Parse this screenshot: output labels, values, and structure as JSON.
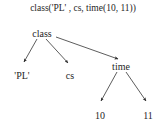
{
  "figure": {
    "caption": "class('PL' , cs, time(10, 11))",
    "type": "parse-tree",
    "line_color": "#333333",
    "text_color": "#262626",
    "background_color": "#ffffff"
  },
  "tree": {
    "root": {
      "label": "class",
      "children": [
        {
          "label": "'PL'",
          "children": []
        },
        {
          "label": "cs",
          "children": []
        },
        {
          "label": "time",
          "children": [
            {
              "label": "10",
              "children": []
            },
            {
              "label": "11",
              "children": []
            }
          ]
        }
      ]
    }
  },
  "nodes": [
    {
      "id": "root",
      "label": "class",
      "x": 42,
      "y": 34
    },
    {
      "id": "pl",
      "label": "'PL'",
      "x": 22,
      "y": 76
    },
    {
      "id": "cs",
      "label": "cs",
      "x": 70,
      "y": 76
    },
    {
      "id": "time",
      "label": "time",
      "x": 121,
      "y": 67
    },
    {
      "id": "ten",
      "label": "10",
      "x": 100,
      "y": 116
    },
    {
      "id": "eleven",
      "label": "11",
      "x": 148,
      "y": 116
    }
  ],
  "edges": [
    {
      "from": "class",
      "to": "'PL'"
    },
    {
      "from": "class",
      "to": "cs"
    },
    {
      "from": "class",
      "to": "time"
    },
    {
      "from": "time",
      "to": "10"
    },
    {
      "from": "time",
      "to": "11"
    }
  ]
}
